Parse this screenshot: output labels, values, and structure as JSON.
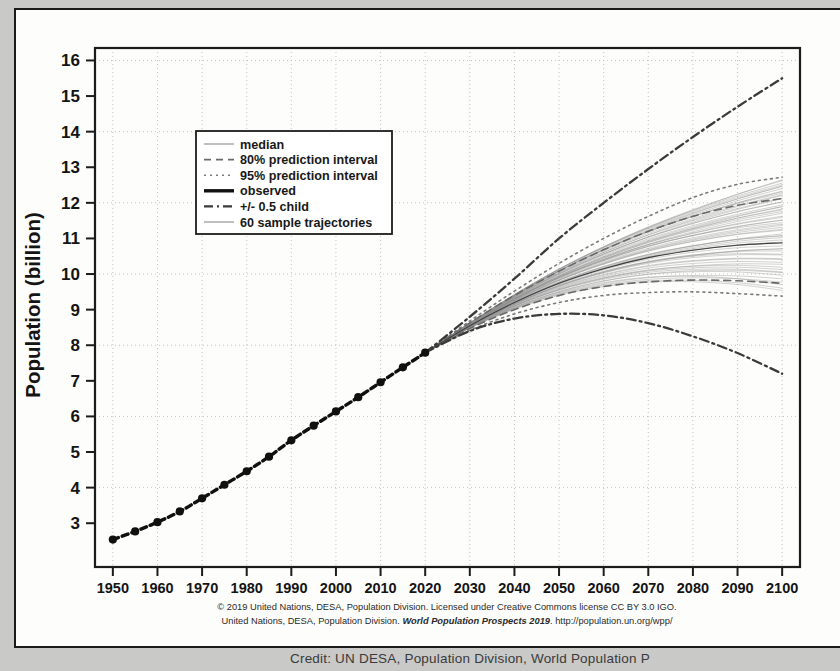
{
  "figure": {
    "caption_line1": "© 2019 United Nations, DESA, Population Division. Licensed under Creative Commons license CC BY 3.0 IGO.",
    "caption_line2_a": "United Nations, DESA, Population Division. ",
    "caption_line2_italic": "World Population Prospects 2019",
    "caption_line2_b": ". http://population.un.org/wpp/",
    "credit": "Credit: UN DESA, Population Division, World Population P"
  },
  "chart_data": {
    "type": "line",
    "title": "",
    "xlabel": "",
    "ylabel": "Population (billion)",
    "xlim": [
      1946,
      2104
    ],
    "ylim": [
      1.77,
      16.35
    ],
    "xticks": [
      1950,
      1960,
      1970,
      1980,
      1990,
      2000,
      2010,
      2020,
      2030,
      2040,
      2050,
      2060,
      2070,
      2080,
      2090,
      2100
    ],
    "yticks": [
      3,
      4,
      5,
      6,
      7,
      8,
      9,
      10,
      11,
      12,
      13,
      14,
      15,
      16
    ],
    "grid": true,
    "grid_color": "#c4c4c4",
    "legend_position": "upper-left",
    "series": [
      {
        "name": "observed",
        "style": "solid-thick-markers",
        "color": "#101010",
        "x": [
          1950,
          1955,
          1960,
          1965,
          1970,
          1975,
          1980,
          1985,
          1990,
          1995,
          2000,
          2005,
          2010,
          2015,
          2020
        ],
        "values": [
          2.54,
          2.77,
          3.03,
          3.33,
          3.7,
          4.08,
          4.46,
          4.87,
          5.33,
          5.74,
          6.14,
          6.54,
          6.96,
          7.38,
          7.79
        ]
      },
      {
        "name": "median",
        "style": "solid-thin",
        "color": "#555555",
        "x": [
          2020,
          2030,
          2040,
          2050,
          2060,
          2070,
          2080,
          2090,
          2100
        ],
        "values": [
          7.79,
          8.55,
          9.2,
          9.74,
          10.15,
          10.46,
          10.67,
          10.81,
          10.88
        ]
      },
      {
        "name": "80% prediction interval",
        "style": "dashed",
        "color": "#6a6a6a",
        "x": [
          2020,
          2030,
          2040,
          2050,
          2060,
          2070,
          2080,
          2090,
          2100
        ],
        "upper": [
          7.79,
          8.63,
          9.4,
          10.08,
          10.68,
          11.2,
          11.62,
          11.93,
          12.12
        ],
        "lower": [
          7.79,
          8.47,
          9.0,
          9.4,
          9.65,
          9.78,
          9.83,
          9.81,
          9.74
        ]
      },
      {
        "name": "95% prediction interval",
        "style": "dotted",
        "color": "#7b7b7b",
        "x": [
          2020,
          2030,
          2040,
          2050,
          2060,
          2070,
          2080,
          2090,
          2100
        ],
        "upper": [
          7.79,
          8.68,
          9.52,
          10.3,
          11.0,
          11.62,
          12.15,
          12.52,
          12.72
        ],
        "lower": [
          7.79,
          8.42,
          8.88,
          9.2,
          9.4,
          9.48,
          9.5,
          9.45,
          9.38
        ]
      },
      {
        "name": "+/- 0.5 child upper",
        "style": "dash-dot",
        "color": "#3b3b3b",
        "x": [
          2020,
          2030,
          2040,
          2050,
          2060,
          2070,
          2080,
          2090,
          2100
        ],
        "values": [
          7.79,
          8.8,
          9.87,
          11.0,
          12.0,
          12.95,
          13.85,
          14.7,
          15.5
        ]
      },
      {
        "name": "+/- 0.5 child lower",
        "style": "dash-dot",
        "color": "#3b3b3b",
        "x": [
          2020,
          2030,
          2040,
          2050,
          2060,
          2070,
          2080,
          2090,
          2100
        ],
        "values": [
          7.79,
          8.4,
          8.75,
          8.88,
          8.84,
          8.62,
          8.25,
          7.78,
          7.2
        ]
      },
      {
        "name": "60 sample trajectories",
        "style": "solid-thin-multi",
        "color": "#8a8a8a",
        "count": 60,
        "x": [
          2020,
          2100
        ],
        "spread_2100": [
          9.42,
          12.65
        ]
      }
    ],
    "legend": [
      {
        "label": "median",
        "style": "solid-thin",
        "color": "#8d8d8d"
      },
      {
        "label": "80% prediction interval",
        "style": "dashed",
        "color": "#6a6a6a"
      },
      {
        "label": "95% prediction interval",
        "style": "dotted",
        "color": "#7b7b7b"
      },
      {
        "label": "observed",
        "style": "solid-thick",
        "color": "#101010"
      },
      {
        "label": "+/- 0.5 child",
        "style": "dash-dot",
        "color": "#3b3b3b"
      },
      {
        "label": "60 sample trajectories",
        "style": "solid-thin",
        "color": "#8a8a8a"
      }
    ]
  }
}
